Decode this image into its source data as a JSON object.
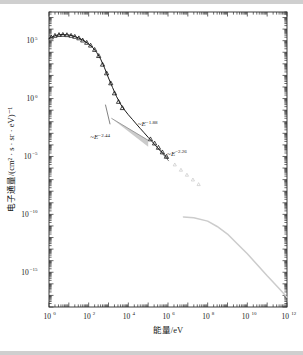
{
  "chart_data": {
    "type": "line",
    "title": "",
    "xlabel": "能量/eV",
    "ylabel": "电子通量/(cm² · s · sr · eV)⁻¹",
    "xscale": "log",
    "yscale": "log",
    "xlim": [
      1,
      1000000000000.0
    ],
    "ylim": [
      1e-18,
      30000000.0
    ],
    "grid": false,
    "legend": null,
    "x_ticks": [
      {
        "value": 1,
        "label": "10",
        "exp": "0"
      },
      {
        "value": 100,
        "label": "10",
        "exp": "2"
      },
      {
        "value": 10000,
        "label": "10",
        "exp": "4"
      },
      {
        "value": 1000000,
        "label": "10",
        "exp": "6"
      },
      {
        "value": 100000000,
        "label": "10",
        "exp": "8"
      },
      {
        "value": 10000000000,
        "label": "10",
        "exp": "10"
      },
      {
        "value": 1000000000000,
        "label": "10",
        "exp": "12"
      }
    ],
    "y_ticks": [
      {
        "value": 100000.0,
        "label": "10",
        "exp": "5"
      },
      {
        "value": 1.0,
        "label": "10",
        "exp": "0"
      },
      {
        "value": 1e-05,
        "label": "10",
        "exp": "−5"
      },
      {
        "value": 1e-10,
        "label": "10",
        "exp": "−10"
      },
      {
        "value": 1e-15,
        "label": "10",
        "exp": "−15"
      }
    ],
    "annotations": [
      {
        "name": "slope-low-energy",
        "text": "~E",
        "exponent": "−2.44",
        "x": 120,
        "y": 0.0003
      },
      {
        "name": "slope-mid-energy",
        "text": "~E",
        "exponent": "−1.88",
        "x": 30000.0,
        "y": 0.004
      },
      {
        "name": "slope-high-energy",
        "text": "~E",
        "exponent": "−2.26",
        "x": 900000.0,
        "y": 1.1e-05
      }
    ],
    "series": [
      {
        "name": "electron-flux-main-curve",
        "style": "solid-black-line",
        "color": "#1a1a1a",
        "points": [
          [
            1.0,
            150000.0
          ],
          [
            1.6,
            230000.0
          ],
          [
            2.5,
            300000.0
          ],
          [
            4.0,
            340000.0
          ],
          [
            6.3,
            330000.0
          ],
          [
            10,
            310000.0
          ],
          [
            16,
            260000.0
          ],
          [
            25,
            200000.0
          ],
          [
            40,
            140000.0
          ],
          [
            63,
            90000.0
          ],
          [
            100,
            52000.0
          ],
          [
            160,
            26000.0
          ],
          [
            250,
            10000.0
          ],
          [
            400,
            2600.0
          ],
          [
            630,
            450.0
          ],
          [
            1000,
            60.0
          ],
          [
            1600,
            9.0
          ],
          [
            2500,
            1.6
          ],
          [
            4000,
            0.34
          ],
          [
            6300,
            0.11
          ],
          [
            10000,
            0.04
          ],
          [
            16000,
            0.016
          ],
          [
            25000,
            0.0065
          ],
          [
            40000,
            0.0026
          ],
          [
            63000,
            0.0011
          ],
          [
            100000,
            0.00045
          ],
          [
            160000,
            0.00019
          ],
          [
            250000,
            8e-05
          ],
          [
            400000,
            3.4e-05
          ],
          [
            630000,
            1.5e-05
          ],
          [
            1000000,
            6.5e-06
          ]
        ]
      },
      {
        "name": "electron-flux-markers",
        "style": "open-triangle-markers",
        "color": "#1a1a1a",
        "points": [
          [
            1.3,
            200000.0
          ],
          [
            2.0,
            280000.0
          ],
          [
            3.2,
            330000.0
          ],
          [
            5.0,
            340000.0
          ],
          [
            8.0,
            320000.0
          ],
          [
            13,
            280000.0
          ],
          [
            20,
            230000.0
          ],
          [
            32,
            170000.0
          ],
          [
            50,
            110000.0
          ],
          [
            80,
            70000.0
          ],
          [
            125,
            40000.0
          ],
          [
            200,
            17000.0
          ],
          [
            320,
            5000.0
          ],
          [
            500,
            900.0
          ],
          [
            800,
            160.0
          ],
          [
            1300,
            22.0
          ],
          [
            2000,
            3.0
          ],
          [
            3200,
            0.55
          ],
          [
            5000,
            0.16
          ],
          [
            130000,
            0.00032
          ],
          [
            210000,
            0.00014
          ],
          [
            330000,
            6e-05
          ],
          [
            520000,
            2.4e-05
          ],
          [
            830000,
            1e-05
          ]
        ]
      },
      {
        "name": "faint-gray-points",
        "style": "faint-gray-markers",
        "color": "#c9c9c9",
        "points": [
          [
            2200000.0,
            2e-06
          ],
          [
            4500000.0,
            7e-07
          ],
          [
            9000000.0,
            2.6e-07
          ],
          [
            18000000.0,
            1e-07
          ],
          [
            35000000.0,
            4e-08
          ]
        ]
      },
      {
        "name": "gray-high-energy-curve",
        "style": "gray-line",
        "color": "#cccccc",
        "points": [
          [
            6000000.0,
            6e-11
          ],
          [
            20000000.0,
            5e-11
          ],
          [
            100000000.0,
            2.6e-11
          ],
          [
            300000000.0,
            9e-12
          ],
          [
            1000000000.0,
            2e-12
          ],
          [
            3000000000.0,
            3e-13
          ],
          [
            10000000000.0,
            4e-14
          ],
          [
            30000000000.0,
            5e-15
          ],
          [
            100000000000.0,
            5e-16
          ],
          [
            400000000000.0,
            4e-17
          ],
          [
            1000000000000.0,
            7e-18
          ]
        ]
      }
    ]
  }
}
